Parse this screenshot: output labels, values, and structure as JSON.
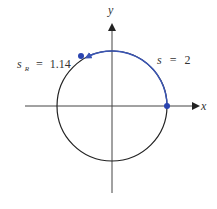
{
  "diagram": {
    "title": "",
    "axes": {
      "x_label": "x",
      "y_label": "y"
    },
    "circle": {
      "type": "unit circle",
      "center_px": [
        112,
        106
      ],
      "radius_px": 55
    },
    "arc": {
      "label_var": "s",
      "label_eq": "=",
      "label_value": "2",
      "from_angle_rad": 0,
      "to_angle_rad": 2,
      "direction": "counterclockwise"
    },
    "reference": {
      "label_var": "s",
      "label_sub": "R",
      "label_eq": "=",
      "label_value": "1.14"
    },
    "colors": {
      "arc": "#3a55b5",
      "point": "#2a44b0",
      "circle": "#222222",
      "axis": "#444444"
    }
  }
}
